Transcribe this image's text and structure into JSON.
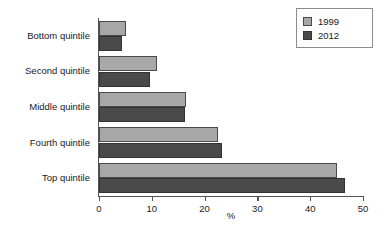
{
  "chart_data": {
    "type": "bar",
    "orientation": "horizontal",
    "title": "",
    "xlabel": "%",
    "ylabel": "",
    "xlim": [
      0,
      50
    ],
    "xticks": [
      0,
      10,
      20,
      30,
      40,
      50
    ],
    "grid": false,
    "legend_position": "top-right",
    "categories": [
      "Bottom quintile",
      "Second quintile",
      "Middle quintile",
      "Fourth quintile",
      "Top quintile"
    ],
    "series": [
      {
        "name": "1999",
        "color": "#a8a8a8",
        "values": [
          5.2,
          11.0,
          16.4,
          22.5,
          45.0
        ]
      },
      {
        "name": "2012",
        "color": "#4a4a4a",
        "values": [
          4.3,
          9.7,
          16.3,
          23.3,
          46.5
        ]
      }
    ]
  },
  "legend": {
    "items": [
      {
        "label": "1999",
        "color": "#a8a8a8"
      },
      {
        "label": "2012",
        "color": "#4a4a4a"
      }
    ]
  },
  "axis": {
    "x_title": "%"
  }
}
